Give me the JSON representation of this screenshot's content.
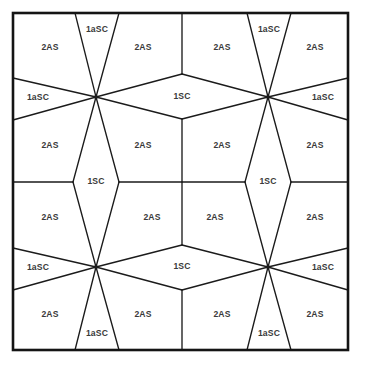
{
  "figure": {
    "name": "tiling-diagram",
    "width": 365,
    "height": 374,
    "background_color": "#ffffff",
    "line_color": "#1b1b1b",
    "border_color": "#141414",
    "label_color": "#3a3a3a"
  },
  "frame": {
    "x0": 13,
    "y0": 13,
    "x1": 348,
    "y1": 350
  },
  "labels": [
    {
      "id": "lbl-2as-r1c1",
      "text": "2AS",
      "x": 50,
      "y": 48
    },
    {
      "id": "lbl-1asc-top-left",
      "text": "1aSC",
      "x": 97,
      "y": 30
    },
    {
      "id": "lbl-2as-r1c2",
      "text": "2AS",
      "x": 143,
      "y": 48
    },
    {
      "id": "lbl-2as-r1c3",
      "text": "2AS",
      "x": 222,
      "y": 48
    },
    {
      "id": "lbl-1asc-top-right",
      "text": "1aSC",
      "x": 269,
      "y": 30
    },
    {
      "id": "lbl-2as-r1c4",
      "text": "2AS",
      "x": 315,
      "y": 48
    },
    {
      "id": "lbl-1asc-left-upper",
      "text": "1aSC",
      "x": 38,
      "y": 98
    },
    {
      "id": "lbl-1sc-top-center",
      "text": "1SC",
      "x": 182,
      "y": 97
    },
    {
      "id": "lbl-1asc-right-upper",
      "text": "1aSC",
      "x": 323,
      "y": 98
    },
    {
      "id": "lbl-2as-r2c1",
      "text": "2AS",
      "x": 50,
      "y": 146
    },
    {
      "id": "lbl-2as-r2c2",
      "text": "2AS",
      "x": 143,
      "y": 146
    },
    {
      "id": "lbl-2as-r2c3",
      "text": "2AS",
      "x": 222,
      "y": 146
    },
    {
      "id": "lbl-2as-r2c4",
      "text": "2AS",
      "x": 315,
      "y": 146
    },
    {
      "id": "lbl-1sc-mid-left",
      "text": "1SC",
      "x": 96,
      "y": 182
    },
    {
      "id": "lbl-1sc-mid-right",
      "text": "1SC",
      "x": 268,
      "y": 182
    },
    {
      "id": "lbl-2as-r3c1",
      "text": "2AS",
      "x": 50,
      "y": 218
    },
    {
      "id": "lbl-2as-r3c2",
      "text": "2AS",
      "x": 152,
      "y": 218
    },
    {
      "id": "lbl-2as-r3c3",
      "text": "2AS",
      "x": 215,
      "y": 218
    },
    {
      "id": "lbl-2as-r3c4",
      "text": "2AS",
      "x": 315,
      "y": 218
    },
    {
      "id": "lbl-1asc-left-lower",
      "text": "1aSC",
      "x": 38,
      "y": 268
    },
    {
      "id": "lbl-1sc-bottom-center",
      "text": "1SC",
      "x": 182,
      "y": 267
    },
    {
      "id": "lbl-1asc-right-lower",
      "text": "1aSC",
      "x": 323,
      "y": 268
    },
    {
      "id": "lbl-2as-r4c1",
      "text": "2AS",
      "x": 50,
      "y": 315
    },
    {
      "id": "lbl-2as-r4c2",
      "text": "2AS",
      "x": 143,
      "y": 315
    },
    {
      "id": "lbl-2as-r4c3",
      "text": "2AS",
      "x": 222,
      "y": 315
    },
    {
      "id": "lbl-2as-r4c4",
      "text": "2AS",
      "x": 315,
      "y": 315
    },
    {
      "id": "lbl-1asc-bottom-left",
      "text": "1aSC",
      "x": 97,
      "y": 334
    },
    {
      "id": "lbl-1asc-bottom-right",
      "text": "1aSC",
      "x": 269,
      "y": 334
    }
  ],
  "edges": [
    {
      "id": "e-top-left-v1",
      "d": "M 75 13 L 96 97"
    },
    {
      "id": "e-top-left-v2",
      "d": "M 119 13 L 96 97"
    },
    {
      "id": "e-top-right-v1",
      "d": "M 247 13 L 268 97"
    },
    {
      "id": "e-top-right-v2",
      "d": "M 291 13 L 268 97"
    },
    {
      "id": "e-left-diag-up",
      "d": "M 13 78 L 96 97"
    },
    {
      "id": "e-left-diag-down",
      "d": "M 13 120 L 96 97"
    },
    {
      "id": "e-right-diag-up",
      "d": "M 348 78 L 268 97"
    },
    {
      "id": "e-right-diag-down",
      "d": "M 348 120 L 268 97"
    },
    {
      "id": "e-hex-top-left",
      "d": "M 96 97 L 182 74"
    },
    {
      "id": "e-hex-top-right",
      "d": "M 182 74 L 268 97"
    },
    {
      "id": "e-hex-bot-left",
      "d": "M 96 97 L 182 119"
    },
    {
      "id": "e-hex-bot-right",
      "d": "M 182 119 L 268 97"
    },
    {
      "id": "e-rhomb-left-upper-l",
      "d": "M 96 97 L 73 182"
    },
    {
      "id": "e-rhomb-left-upper-r",
      "d": "M 96 97 L 119 182"
    },
    {
      "id": "e-rhomb-left-lower-l",
      "d": "M 73 182 L 96 267"
    },
    {
      "id": "e-rhomb-left-lower-r",
      "d": "M 119 182 L 96 267"
    },
    {
      "id": "e-rhomb-right-upper-l",
      "d": "M 268 97 L 245 182"
    },
    {
      "id": "e-rhomb-right-upper-r",
      "d": "M 268 97 L 291 182"
    },
    {
      "id": "e-rhomb-right-lower-l",
      "d": "M 245 182 L 268 267"
    },
    {
      "id": "e-rhomb-right-lower-r",
      "d": "M 291 182 L 268 267"
    },
    {
      "id": "e-mid-h-left",
      "d": "M 13 182 L 73 182"
    },
    {
      "id": "e-mid-h-center",
      "d": "M 119 182 L 245 182"
    },
    {
      "id": "e-mid-h-right",
      "d": "M 291 182 L 348 182"
    },
    {
      "id": "e-vert-center-upper",
      "d": "M 182 119 L 182 182"
    },
    {
      "id": "e-vert-center-lower",
      "d": "M 182 182 L 182 245"
    },
    {
      "id": "e-hex2-top-left",
      "d": "M 96 267 L 182 245"
    },
    {
      "id": "e-hex2-top-right",
      "d": "M 182 245 L 268 267"
    },
    {
      "id": "e-hex2-bot-left",
      "d": "M 96 267 L 182 290"
    },
    {
      "id": "e-hex2-bot-right",
      "d": "M 182 290 L 268 267"
    },
    {
      "id": "e-left-diag-up2",
      "d": "M 13 248 L 96 267"
    },
    {
      "id": "e-left-diag-down2",
      "d": "M 13 290 L 96 267"
    },
    {
      "id": "e-right-diag-up2",
      "d": "M 348 248 L 268 267"
    },
    {
      "id": "e-right-diag-down2",
      "d": "M 348 290 L 268 267"
    },
    {
      "id": "e-bot-left-v1",
      "d": "M 96 267 L 75 350"
    },
    {
      "id": "e-bot-left-v2",
      "d": "M 96 267 L 119 350"
    },
    {
      "id": "e-bot-right-v1",
      "d": "M 268 267 L 247 350"
    },
    {
      "id": "e-bot-right-v2",
      "d": "M 268 267 L 291 350"
    },
    {
      "id": "e-vert-top-edge",
      "d": "M 182 13 L 182 74"
    },
    {
      "id": "e-vert-bottom-edge",
      "d": "M 182 290 L 182 350"
    }
  ],
  "vertices": [
    {
      "id": "vtx-upper-left",
      "cx": 96,
      "cy": 97
    },
    {
      "id": "vtx-upper-right",
      "cx": 268,
      "cy": 97
    },
    {
      "id": "vtx-lower-left",
      "cx": 96,
      "cy": 267
    },
    {
      "id": "vtx-lower-right",
      "cx": 268,
      "cy": 267
    }
  ]
}
